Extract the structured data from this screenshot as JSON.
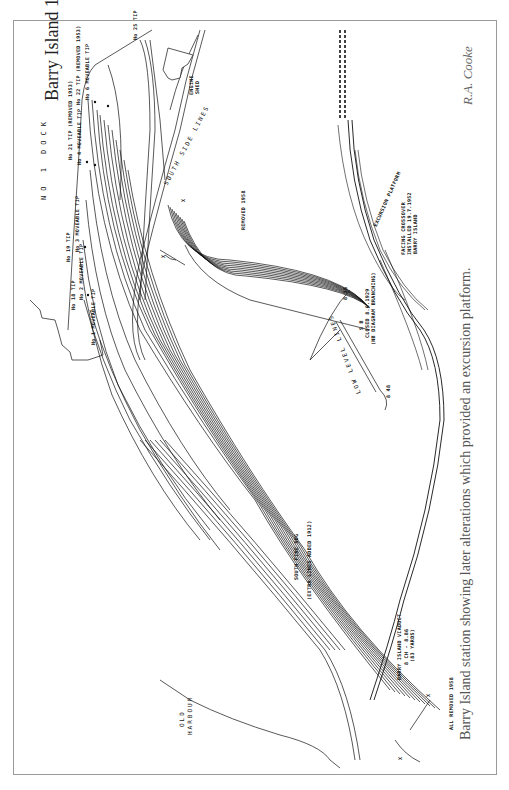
{
  "figure": {
    "title": "Barry Island 1927",
    "caption": "Barry Island station showing later alterations which provided an excursion platform.",
    "credit": "R.A. Cooke"
  },
  "labels": {
    "no1_dock": "NO  1  DOCK",
    "old_harbour_1": "OLD",
    "old_harbour_2": "HARBOUR",
    "south_side_lines": "SOUTH  SIDE  LINES",
    "low_level_lines": "LOW  LEVEL  LINES",
    "barry_island": "BARRY ISLAND",
    "engine_shed_1": "ENGINE",
    "engine_shed_2": "SHED",
    "tip_no25": "No 25 TIP",
    "tip_no22": "No 22 TIP (REMOVED 1953)",
    "movable_tip_no6": "No 6 MOVEABLE TIP",
    "tip_no21": "No 21 TIP (REMOVED 1953)",
    "movable_tip_no4": "No 4 MOVEABLE TIP",
    "movable_tip_no3": "No 3 MOVEABLE TIP",
    "tip_no19": "No 19 TIP",
    "movable_tip_no2": "No 2 MOVEABLE TIP",
    "tip_no18": "No 18 TIP",
    "movable_tip_no1": "No 1 MOVEABLE TIP",
    "removed_1958": "REMOVED 1958",
    "all_removed_1958": "ALL REMOVED 1958",
    "south_fine_sdg": "SOUTH FINE SDG",
    "extra_lines": "(EXTRA LINES ADDED 1912)",
    "viaduct_1": "BARRY ISLAND VIADUCT",
    "viaduct_2": "8 CH - 8.86",
    "viaduct_3": "(83 YARDS)",
    "signal_box_1": "S B",
    "signal_box_2": "CLOSED 8.6.1929",
    "signal_box_3": "(NB DIAGRAM BRANCHING)",
    "facing_crossover_1": "FACING CROSSOVER",
    "facing_crossover_2": "INSTALLED 19.7.1952",
    "excursion_platform": "EXCURSION PLATFORM",
    "mark_x": "X",
    "mileage_1": "8 36",
    "mileage_2": "8 48",
    "mileage_3": "8 64"
  }
}
